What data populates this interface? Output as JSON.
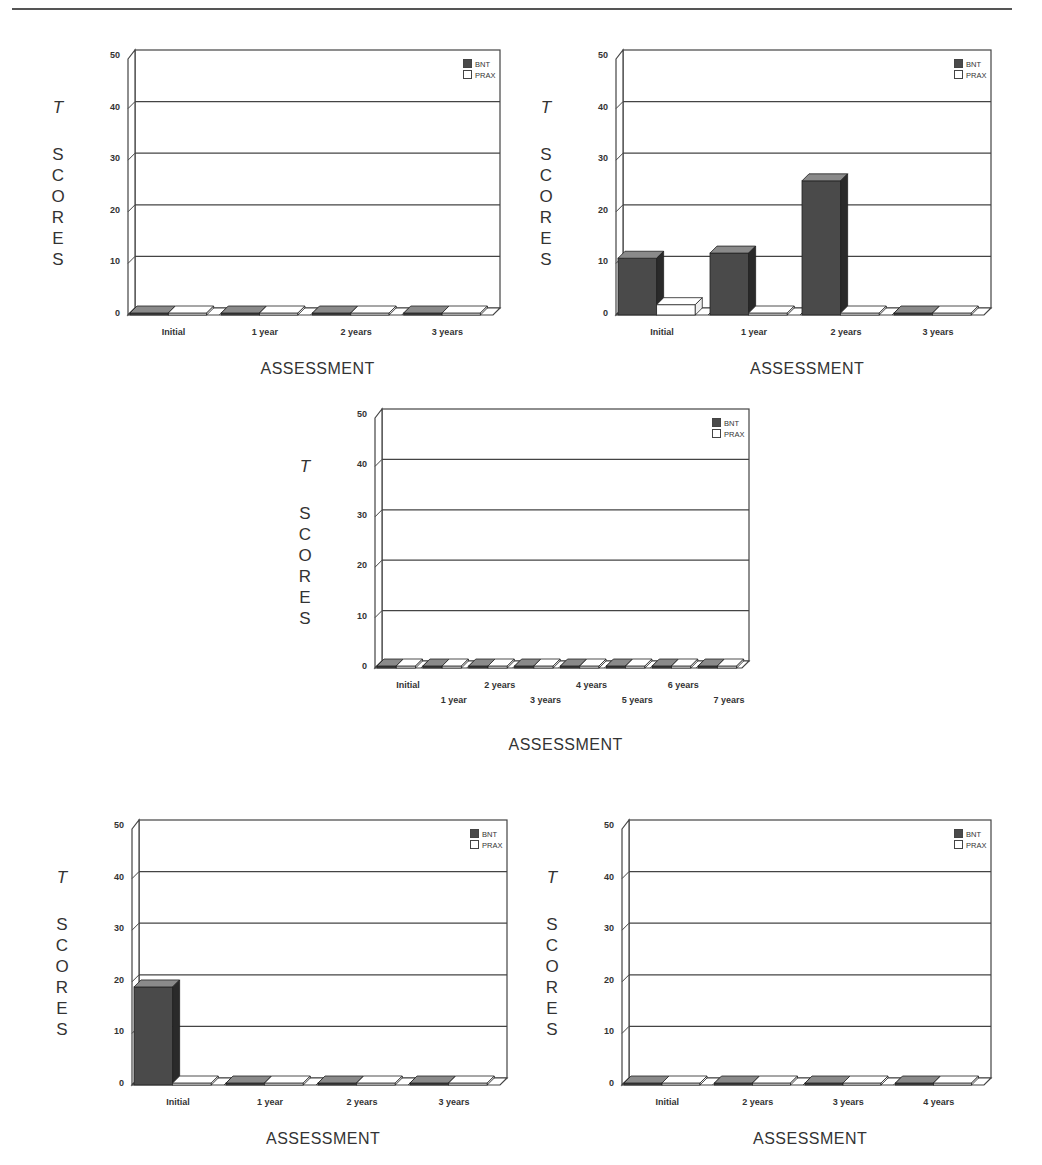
{
  "page": {
    "header_rule": true
  },
  "common": {
    "ylabel_letters": [
      "S",
      "C",
      "O",
      "R",
      "E",
      "S"
    ],
    "ylabel_t": "T",
    "xlabel": "ASSESSMENT",
    "yticks": [
      "0",
      "10",
      "20",
      "30",
      "40",
      "50"
    ],
    "legend": [
      {
        "name": "BNT",
        "color": "#4a4a4a"
      },
      {
        "name": "PRAX",
        "color": "#ffffff"
      }
    ],
    "colors": {
      "bnt": "#4a4a4a",
      "bnt_top": "#8a8a8a",
      "bnt_side": "#2a2a2a",
      "prax": "#ffffff",
      "grid": "#444444"
    }
  },
  "chart_data": [
    {
      "type": "bar",
      "title": "",
      "position": "top-left",
      "xlabel": "ASSESSMENT",
      "ylabel": "T SCORES",
      "ylim": [
        0,
        50
      ],
      "categories": [
        "Initial",
        "1 year",
        "2 years",
        "3 years"
      ],
      "series": [
        {
          "name": "BNT",
          "values": [
            0,
            0,
            0,
            0
          ]
        },
        {
          "name": "PRAX",
          "values": [
            0,
            0,
            0,
            0
          ]
        }
      ],
      "grid": true,
      "legend_position": "top-right"
    },
    {
      "type": "bar",
      "title": "",
      "position": "top-right",
      "xlabel": "ASSESSMENT",
      "ylabel": "T SCORES",
      "ylim": [
        0,
        50
      ],
      "categories": [
        "Initial",
        "1 year",
        "2 years",
        "3 years"
      ],
      "series": [
        {
          "name": "BNT",
          "values": [
            11,
            12,
            26,
            0
          ]
        },
        {
          "name": "PRAX",
          "values": [
            2,
            0,
            0,
            0
          ]
        }
      ],
      "grid": true,
      "legend_position": "top-right"
    },
    {
      "type": "bar",
      "title": "",
      "position": "middle",
      "xlabel": "ASSESSMENT",
      "ylabel": "T SCORES",
      "ylim": [
        0,
        50
      ],
      "categories": [
        "Initial",
        "1 year",
        "2 years",
        "3 years",
        "4 years",
        "5 years",
        "6 years",
        "7 years"
      ],
      "series": [
        {
          "name": "BNT",
          "values": [
            0,
            0,
            0,
            0,
            0,
            0,
            0,
            0
          ]
        },
        {
          "name": "PRAX",
          "values": [
            0,
            0,
            0,
            0,
            0,
            0,
            0,
            0
          ]
        }
      ],
      "grid": true,
      "legend_position": "top-right"
    },
    {
      "type": "bar",
      "title": "",
      "position": "bottom-left",
      "xlabel": "ASSESSMENT",
      "ylabel": "T SCORES",
      "ylim": [
        0,
        50
      ],
      "categories": [
        "Initial",
        "1 year",
        "2 years",
        "3 years"
      ],
      "series": [
        {
          "name": "BNT",
          "values": [
            19,
            0,
            0,
            0
          ]
        },
        {
          "name": "PRAX",
          "values": [
            0,
            0,
            0,
            0
          ]
        }
      ],
      "grid": true,
      "legend_position": "top-right"
    },
    {
      "type": "bar",
      "title": "",
      "position": "bottom-right",
      "xlabel": "ASSESSMENT",
      "ylabel": "T SCORES",
      "ylim": [
        0,
        50
      ],
      "categories": [
        "Initial",
        "2 years",
        "3 years",
        "4 years"
      ],
      "series": [
        {
          "name": "BNT",
          "values": [
            0,
            0,
            0,
            0
          ]
        },
        {
          "name": "PRAX",
          "values": [
            0,
            0,
            0,
            0
          ]
        }
      ],
      "grid": true,
      "legend_position": "top-right"
    }
  ]
}
